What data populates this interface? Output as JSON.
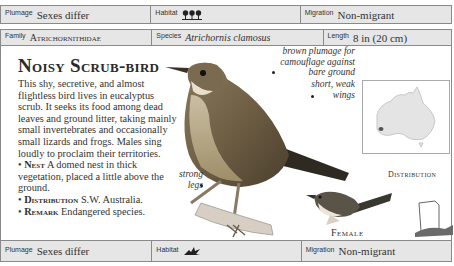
{
  "top_strip": {
    "plumage_label": "Plumage",
    "plumage_value": "Sexes differ",
    "habitat_label": "Habitat",
    "habitat_icon": "forest-trees-icon",
    "migration_label": "Migration",
    "migration_value": "Non-migrant"
  },
  "header": {
    "family_label": "Family",
    "family_value": "Atrichornithidae",
    "species_label": "Species",
    "species_value": "Atrichornis clamosus",
    "length_label": "Length",
    "length_value": "8 in (20 cm)"
  },
  "main": {
    "title": "Noisy Scrub-bird",
    "description": "This shy, secretive, and almost flightless bird lives in eucalyptus scrub. It seeks its food among dead leaves and ground litter, taking mainly small invertebrates and occasionally small lizards and frogs. Males sing loudly to proclaim their territories.",
    "facts": [
      {
        "label": "Nest",
        "text": "A domed nest in thick vegetation, placed a little above the ground."
      },
      {
        "label": "Distribution",
        "text": "S.W. Australia."
      },
      {
        "label": "Remark",
        "text": "Endangered species."
      }
    ],
    "annotations": {
      "plumage": "brown plumage for camouflage against bare ground",
      "wings": "short, weak wings",
      "legs": "strong legs"
    },
    "map_caption": "Distribution",
    "female_caption": "Female"
  },
  "bottom_strip": {
    "plumage_label": "Plumage",
    "plumage_value": "Sexes differ",
    "habitat_label": "Habitat",
    "habitat_icon": "scrub-bush-icon",
    "migration_label": "Migration",
    "migration_value": "Non-migrant"
  }
}
